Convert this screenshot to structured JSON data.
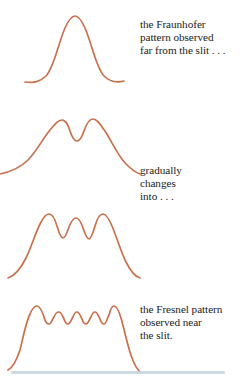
{
  "figure": {
    "name": "fraunhofer-to-fresnel-diffraction-sequence",
    "background_color": "#ffffff",
    "curve_color": "#c8714e",
    "text_color": "#211c1a",
    "rule_color": "#c3d2dc"
  },
  "captions": {
    "fraunhofer": {
      "lines": [
        "the Fraunhofer",
        "pattern observed",
        "far from the slit . . ."
      ]
    },
    "gradually": {
      "lines": [
        "gradually",
        "changes",
        "into . . ."
      ]
    },
    "fresnel": {
      "lines": [
        "the Fresnel pattern",
        "observed near",
        "the slit."
      ]
    }
  },
  "chart_data": {
    "type": "line",
    "title": "",
    "xlabel": "",
    "ylabel": "",
    "grid": false,
    "legend": "none",
    "series": [
      {
        "name": "fraunhofer-single-peak",
        "label": "the Fraunhofer pattern observed far from the slit",
        "peaks": 1,
        "path": "M 25 78 C 34 79 40 78 46 72 C 54 64 58 40 65 24 C 69 15 72 12 75 12 C 78 12 81 15 85 24 C 92 40 96 64 104 72 C 110 78 116 79 124 77"
      },
      {
        "name": "two-lobe-transition",
        "label": "gradually changes into",
        "peaks": 2,
        "path": "M 0 76 C 10 74 20 70 28 62 C 36 54 42 42 50 32 C 55 26 58 22 62 22 C 66 22 68 27 70 33 C 72 39 74 43 77 43 C 80 43 82 39 84 33 C 86 27 89 21 93 21 C 97 21 100 26 105 33 C 112 44 118 58 126 66 C 132 72 137 75 140 76"
      },
      {
        "name": "four-peak-transition",
        "label": "gradually changes into",
        "peaks": 4,
        "path": "M 8 86 C 14 84 20 78 26 66 C 31 56 35 42 40 32 C 43 26 46 22 49 22 C 52 22 55 27 57 34 C 59 41 61 46 63 46 C 65 46 67 41 69 35 C 71 30 73 26 76 26 C 79 26 81 30 83 36 C 85 42 87 47 89 47 C 91 47 93 41 95 34 C 97 27 100 22 103 22 C 106 22 109 27 112 34 C 117 46 121 60 126 70 C 131 80 136 85 140 86"
      },
      {
        "name": "fresnel-flat-top-rippled",
        "label": "the Fresnel pattern observed near the slit",
        "peaks": 12,
        "flat_top": true,
        "path": "M 8 86 C 12 84 16 78 20 66 C 23 54 26 38 30 30 C 32 25 34 22 37 22 C 40 22 42 27 44 33 C 45 37 47 40 49 40 C 51 40 52 36 54 33 C 55 30 57 28 59 28 C 61 28 62 31 64 35 C 65 38 67 40 68 40 C 70 40 71 36 73 33 C 74 30 76 28 77 28 C 79 28 80 31 82 35 C 83 38 85 40 86 40 C 88 40 89 36 91 33 C 92 30 94 28 95 28 C 97 28 98 31 100 35 C 101 38 103 40 104 40 C 106 40 107 35 109 31 C 110 27 112 22 114 22 C 117 22 119 27 121 34 C 125 48 128 64 132 74 C 135 82 138 86 140 88"
      }
    ]
  }
}
